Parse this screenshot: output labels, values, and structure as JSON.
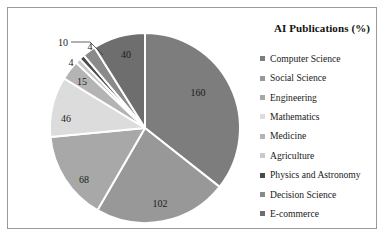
{
  "frame": {
    "border_color": "#9a9a9a",
    "background": "#ffffff"
  },
  "legend": {
    "title": "AI Publications (%)",
    "items": [
      {
        "label": "Computer Science",
        "color": "#7d7d7d"
      },
      {
        "label": "Social Science",
        "color": "#989898"
      },
      {
        "label": "Engineering",
        "color": "#a8a8a8"
      },
      {
        "label": "Mathematics",
        "color": "#dcdcdc"
      },
      {
        "label": "Medicine",
        "color": "#b4b4b4"
      },
      {
        "label": "Agriculture",
        "color": "#c9c9c9"
      },
      {
        "label": "Physics and Astronomy",
        "color": "#4a4a4a"
      },
      {
        "label": "Decision Science",
        "color": "#8a8a8a"
      },
      {
        "label": "E-commerce",
        "color": "#6e6e6e"
      }
    ]
  },
  "chart_data": {
    "type": "pie",
    "title": "AI Publications (%)",
    "xlabel": "",
    "ylabel": "",
    "legend_position": "right",
    "grid": false,
    "start_angle_deg": 0,
    "direction": "clockwise",
    "total": 449,
    "categories": [
      "Computer Science",
      "Social Science",
      "Engineering",
      "Mathematics",
      "Medicine",
      "Agriculture",
      "Physics and Astronomy",
      "Decision Science",
      "E-commerce"
    ],
    "values": [
      160,
      102,
      68,
      46,
      15,
      4,
      4,
      10,
      40
    ],
    "colors": [
      "#7d7d7d",
      "#989898",
      "#a8a8a8",
      "#dcdcdc",
      "#b4b4b4",
      "#c9c9c9",
      "#4a4a4a",
      "#8a8a8a",
      "#6e6e6e"
    ],
    "data_labels": [
      "160",
      "102",
      "68",
      "46",
      "15",
      "4",
      "4",
      "10",
      "40"
    ],
    "label_placement": [
      {
        "value": "160",
        "x": 190,
        "y": 85,
        "leader": false
      },
      {
        "value": "102",
        "x": 152,
        "y": 196,
        "leader": false
      },
      {
        "value": "68",
        "x": 76,
        "y": 172,
        "leader": false
      },
      {
        "value": "46",
        "x": 58,
        "y": 111,
        "leader": false
      },
      {
        "value": "15",
        "x": 74,
        "y": 74,
        "leader": false
      },
      {
        "value": "4",
        "x": 63,
        "y": 55,
        "leader": false
      },
      {
        "value": "4",
        "x": 82,
        "y": 39,
        "leader": false
      },
      {
        "value": "10",
        "x": 55,
        "y": 35,
        "leader": true
      },
      {
        "value": "40",
        "x": 118,
        "y": 47,
        "leader": false
      }
    ],
    "geometry": {
      "center_x": 137,
      "center_y": 120,
      "radius": 95,
      "slice_border_color": "#ffffff",
      "slice_border_width": 2
    }
  }
}
